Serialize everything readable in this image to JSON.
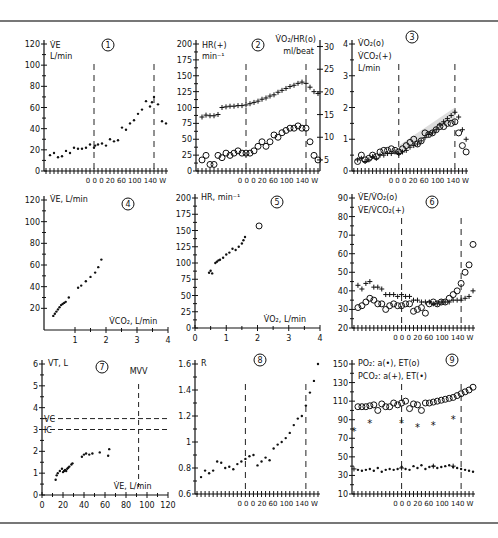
{
  "figure": {
    "x_label_common": "0 0 0 20  60 100 140 W",
    "grid_labels": [
      "1",
      "2",
      "3",
      "4",
      "5",
      "6",
      "7",
      "8",
      "9"
    ]
  },
  "chart_data": [
    {
      "id": "1",
      "type": "scatter",
      "title": "1",
      "ylabel": "V̇E",
      "yunit": "L/min",
      "yticks": [
        0,
        20,
        40,
        60,
        80,
        100,
        120
      ],
      "ylim": [
        0,
        120
      ],
      "xlabel": "0 0 0 20  60 100 140 W",
      "thresholds_x": [
        12,
        27
      ],
      "series": [
        {
          "name": "V̇E",
          "marker": "dot",
          "x": [
            1,
            2,
            3,
            4,
            5,
            6,
            7,
            8,
            9,
            10,
            11,
            12,
            12.3,
            13,
            14,
            15,
            16,
            17,
            18,
            19,
            20,
            21,
            22,
            23,
            24,
            25,
            26,
            26.5,
            27,
            28,
            29,
            30
          ],
          "y": [
            15,
            17,
            13,
            14,
            19,
            17,
            22,
            21,
            21,
            22,
            25,
            22,
            24,
            25,
            26,
            24,
            30,
            28,
            29,
            41,
            39,
            45,
            48,
            54,
            58,
            66,
            61,
            65,
            70,
            63,
            47,
            45
          ]
        }
      ]
    },
    {
      "id": "2",
      "type": "scatter",
      "title": "2",
      "ylabel": "HR(+)",
      "yunit": "min⁻¹",
      "ylabel_right": "V̇O₂/HR(o)",
      "yunit_right": "ml/beat",
      "yticks": [
        0,
        25,
        50,
        75,
        100,
        125,
        150,
        175,
        200
      ],
      "ylim": [
        0,
        200
      ],
      "yticks_right": [
        5,
        10,
        15,
        20,
        25,
        30
      ],
      "xlabel": "0 0 0 20  60 100 140 W",
      "thresholds_x": [
        12,
        27
      ],
      "series": [
        {
          "name": "HR",
          "marker": "plus",
          "axis": "left",
          "x": [
            1,
            2,
            3,
            4,
            5,
            6,
            7,
            8,
            9,
            10,
            11,
            12,
            13,
            14,
            15,
            16,
            17,
            18,
            19,
            20,
            21,
            22,
            23,
            24,
            25,
            26,
            27,
            28,
            29,
            30
          ],
          "y": [
            85,
            88,
            87,
            87,
            89,
            100,
            101,
            102,
            102,
            103,
            103,
            104,
            106,
            108,
            110,
            113,
            115,
            118,
            120,
            124,
            127,
            130,
            133,
            135,
            138,
            140,
            138,
            132,
            125,
            122
          ]
        },
        {
          "name": "V̇O₂/HR",
          "marker": "circle",
          "axis": "right",
          "x": [
            1,
            2,
            3,
            4,
            5,
            6,
            7,
            8,
            9,
            10,
            11,
            12,
            13,
            14,
            15,
            16,
            17,
            18,
            19,
            20,
            21,
            22,
            23,
            24,
            25,
            26,
            27,
            28,
            29,
            30
          ],
          "y": [
            5,
            6,
            4,
            4,
            6,
            5.5,
            6.5,
            6,
            6.5,
            7,
            6.5,
            6.5,
            6.5,
            7,
            8,
            9,
            8,
            9,
            10.5,
            10,
            11,
            11.5,
            12,
            12,
            12.5,
            12,
            12,
            9,
            6,
            5
          ]
        }
      ]
    },
    {
      "id": "3",
      "type": "scatter",
      "title": "3",
      "ylabel": "V̇O₂(o)",
      "ylabel2": "V̇CO₂(+)",
      "yunit": "L/min",
      "yticks": [
        0,
        1,
        2,
        3,
        4
      ],
      "ylim": [
        0,
        4
      ],
      "xlabel": "0 0 0 20  60 100 140 W",
      "thresholds_x": [
        12,
        27
      ],
      "shaded_band": {
        "x": [
          12,
          27
        ],
        "y_low": [
          0.6,
          1.6
        ],
        "y_high": [
          0.8,
          2.0
        ]
      },
      "series": [
        {
          "name": "V̇O₂",
          "marker": "circle",
          "x": [
            1,
            2,
            3,
            4,
            5,
            6,
            7,
            8,
            9,
            10,
            11,
            12,
            13,
            14,
            15,
            16,
            17,
            18,
            19,
            20,
            21,
            22,
            23,
            24,
            25,
            26,
            27,
            28,
            29,
            30
          ],
          "y": [
            0.3,
            0.5,
            0.35,
            0.4,
            0.5,
            0.45,
            0.6,
            0.65,
            0.65,
            0.7,
            0.65,
            0.6,
            0.7,
            0.8,
            0.9,
            1.0,
            0.85,
            0.95,
            1.2,
            1.15,
            1.2,
            1.3,
            1.4,
            1.4,
            1.5,
            1.5,
            1.55,
            1.2,
            0.8,
            0.6
          ]
        },
        {
          "name": "V̇CO₂",
          "marker": "plus",
          "x": [
            1,
            2,
            3,
            4,
            5,
            6,
            7,
            8,
            9,
            10,
            11,
            12,
            13,
            14,
            15,
            16,
            17,
            18,
            19,
            20,
            21,
            22,
            23,
            24,
            25,
            26,
            27,
            28,
            29,
            30
          ],
          "y": [
            0.35,
            0.4,
            0.3,
            0.35,
            0.45,
            0.4,
            0.5,
            0.5,
            0.55,
            0.55,
            0.6,
            0.55,
            0.6,
            0.65,
            0.75,
            0.8,
            0.85,
            0.95,
            1.05,
            1.15,
            1.2,
            1.3,
            1.45,
            1.55,
            1.65,
            1.75,
            1.85,
            1.7,
            1.3,
            1.0
          ]
        }
      ]
    },
    {
      "id": "4",
      "type": "scatter",
      "title": "4",
      "ylabel": "V̇E, L/min",
      "xlabel": "V̇CO₂, L/min",
      "yticks": [
        20,
        40,
        60,
        80,
        100,
        120
      ],
      "ylim": [
        0,
        120
      ],
      "xticks": [
        1,
        2,
        3,
        4
      ],
      "xlim": [
        0,
        4
      ],
      "series": [
        {
          "name": "V̇E vs V̇CO₂",
          "marker": "dot",
          "x": [
            0.3,
            0.35,
            0.4,
            0.45,
            0.5,
            0.55,
            0.6,
            0.65,
            0.7,
            0.8,
            1.1,
            1.2,
            1.35,
            1.5,
            1.65,
            1.75,
            1.85
          ],
          "y": [
            13,
            15,
            17,
            19,
            21,
            23,
            24,
            25,
            26,
            30,
            39,
            41,
            45,
            49,
            53,
            58,
            65
          ]
        }
      ]
    },
    {
      "id": "5",
      "type": "scatter",
      "title": "5",
      "ylabel": "HR, min⁻¹",
      "xlabel": "V̇O₂, L/min",
      "yticks": [
        0,
        25,
        50,
        75,
        100,
        125,
        150,
        175,
        200
      ],
      "ylim": [
        0,
        200
      ],
      "xticks": [
        0,
        1,
        2,
        3,
        4
      ],
      "xlim": [
        0,
        4
      ],
      "series": [
        {
          "name": "HR vs V̇O₂",
          "marker": "dot",
          "x": [
            0.45,
            0.5,
            0.55,
            0.65,
            0.7,
            0.75,
            0.8,
            0.9,
            1.0,
            1.1,
            1.2,
            1.3,
            1.4,
            1.5,
            1.55,
            1.6
          ],
          "y": [
            85,
            88,
            84,
            100,
            102,
            104,
            105,
            108,
            113,
            116,
            122,
            120,
            125,
            130,
            135,
            140
          ]
        },
        {
          "name": "peak",
          "marker": "circle",
          "x": [
            2.05
          ],
          "y": [
            157
          ]
        }
      ]
    },
    {
      "id": "6",
      "type": "scatter",
      "title": "6",
      "ylabel": "V̇E/V̇O₂(o)",
      "ylabel2": "V̇E/V̇CO₂(+)",
      "yticks": [
        20,
        30,
        40,
        50,
        60,
        70,
        80,
        90
      ],
      "ylim": [
        20,
        90
      ],
      "xlabel": "0 0 0 20  60 100 140 W",
      "thresholds_x": [
        12,
        27
      ],
      "series": [
        {
          "name": "V̇E/V̇O₂",
          "marker": "circle",
          "x": [
            1,
            2,
            3,
            4,
            5,
            6,
            7,
            8,
            9,
            10,
            11,
            12,
            13,
            14,
            15,
            16,
            17,
            18,
            19,
            20,
            21,
            22,
            23,
            24,
            25,
            26,
            27,
            28,
            29,
            30
          ],
          "y": [
            31,
            32,
            34,
            36,
            35,
            33,
            33,
            30,
            32,
            33,
            32,
            32,
            33,
            33,
            29,
            30,
            31,
            28,
            33,
            34,
            33,
            34,
            34,
            36,
            38,
            40,
            44,
            50,
            54,
            65
          ]
        },
        {
          "name": "V̇E/V̇CO₂",
          "marker": "plus",
          "x": [
            1,
            2,
            3,
            4,
            5,
            6,
            7,
            8,
            9,
            10,
            11,
            12,
            13,
            14,
            15,
            16,
            17,
            18,
            19,
            20,
            21,
            22,
            23,
            24,
            25,
            26,
            27,
            28,
            29,
            30
          ],
          "y": [
            43,
            41,
            44,
            45,
            42,
            42,
            41,
            38,
            38,
            38,
            37,
            38,
            37,
            37,
            35,
            35,
            34,
            34,
            34,
            33,
            33,
            34,
            34,
            34,
            35,
            35,
            35,
            36,
            37,
            40
          ]
        }
      ]
    },
    {
      "id": "7",
      "type": "scatter",
      "title": "7",
      "ylabel": "VT, L",
      "xlabel": "V̇E, L/min",
      "yticks": [
        0,
        1,
        2,
        3,
        4,
        5,
        6
      ],
      "ylim": [
        0,
        6
      ],
      "xticks": [
        0,
        20,
        40,
        60,
        80,
        100,
        120
      ],
      "xlim": [
        0,
        120
      ],
      "reference_lines": [
        {
          "label": "VC",
          "axis": "y",
          "value": 3.5
        },
        {
          "label": "IC",
          "axis": "y",
          "value": 3.0
        },
        {
          "label": "MVV",
          "axis": "x",
          "value": 92
        }
      ],
      "series": [
        {
          "name": "VT vs V̇E",
          "marker": "dot",
          "x": [
            13,
            14,
            15,
            17,
            19,
            20,
            21,
            22,
            23,
            24,
            25,
            26,
            28,
            29,
            38,
            40,
            42,
            45,
            48,
            55,
            63,
            64
          ],
          "y": [
            0.7,
            0.9,
            1.0,
            1.1,
            1.2,
            1.05,
            1.1,
            1.15,
            1.1,
            1.2,
            1.25,
            1.3,
            1.4,
            1.45,
            1.75,
            1.85,
            1.9,
            1.85,
            1.9,
            1.95,
            1.8,
            2.1
          ]
        }
      ]
    },
    {
      "id": "8",
      "type": "scatter",
      "title": "8",
      "ylabel": "R",
      "yticks": [
        0.6,
        0.8,
        1.0,
        1.2,
        1.4,
        1.6
      ],
      "ylim": [
        0.6,
        1.6
      ],
      "xlabel": "0 0 0 20  60 100 140 W",
      "thresholds_x": [
        12,
        27
      ],
      "series": [
        {
          "name": "R",
          "marker": "dot",
          "x": [
            1,
            2,
            3,
            4,
            5,
            6,
            7,
            8,
            9,
            10,
            11,
            12,
            13,
            14,
            15,
            16,
            17,
            18,
            19,
            20,
            21,
            22,
            23,
            24,
            25,
            26,
            27,
            28,
            29,
            30
          ],
          "y": [
            0.73,
            0.78,
            0.76,
            0.78,
            0.85,
            0.84,
            0.8,
            0.81,
            0.79,
            0.83,
            0.85,
            0.87,
            0.89,
            0.9,
            0.82,
            0.85,
            0.88,
            0.86,
            0.95,
            0.98,
            1.0,
            1.03,
            1.07,
            1.13,
            1.18,
            1.2,
            1.28,
            1.38,
            1.47,
            1.6
          ]
        }
      ]
    },
    {
      "id": "9",
      "type": "scatter",
      "title": "9",
      "ylabel": "PO₂: a(•), ET(o)",
      "ylabel2": "PCO₂: a(+), ET(•)",
      "yticks": [
        10,
        30,
        50,
        70,
        90,
        110,
        130,
        150
      ],
      "ylim": [
        10,
        150
      ],
      "xlabel": "0 0 0 20  60 100 140 W",
      "thresholds_x": [
        12,
        27
      ],
      "series": [
        {
          "name": "PO₂ ET",
          "marker": "circle",
          "x": [
            1,
            2,
            3,
            4,
            5,
            6,
            7,
            8,
            9,
            10,
            11,
            12,
            13,
            14,
            15,
            16,
            17,
            18,
            19,
            20,
            21,
            22,
            23,
            24,
            25,
            26,
            27,
            28,
            29,
            30
          ],
          "y": [
            104,
            104,
            104,
            105,
            106,
            100,
            107,
            104,
            104,
            108,
            106,
            108,
            110,
            102,
            107,
            106,
            100,
            108,
            108,
            109,
            110,
            111,
            112,
            113,
            114,
            116,
            118,
            120,
            122,
            125
          ]
        },
        {
          "name": "PO₂ a",
          "marker": "star",
          "x": [
            0,
            4,
            12,
            16,
            20,
            25
          ],
          "y": [
            78,
            87,
            86,
            82,
            84,
            91
          ]
        },
        {
          "name": "PCO₂ ET",
          "marker": "dot",
          "x": [
            1,
            2,
            3,
            4,
            5,
            6,
            7,
            8,
            9,
            10,
            11,
            12,
            13,
            14,
            15,
            16,
            17,
            18,
            19,
            20,
            21,
            22,
            23,
            24,
            25,
            26,
            27,
            28,
            29,
            30
          ],
          "y": [
            36,
            35,
            36,
            37,
            35,
            38,
            34,
            36,
            37,
            36,
            37,
            39,
            37,
            36,
            40,
            38,
            41,
            37,
            39,
            40,
            38,
            39,
            40,
            41,
            39,
            38,
            37,
            36,
            35,
            34
          ]
        },
        {
          "name": "PCO₂ a",
          "marker": "plus",
          "x": [
            0,
            12,
            20,
            25
          ],
          "y": [
            37,
            38,
            40,
            40
          ]
        }
      ]
    }
  ]
}
